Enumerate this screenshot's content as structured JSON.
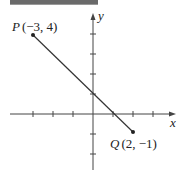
{
  "diagram": {
    "x_axis_label": "x",
    "y_axis_label": "y",
    "points": [
      {
        "name": "P",
        "coords": "(−3, 4)",
        "x": -3,
        "y": 4
      },
      {
        "name": "Q",
        "coords": "(2, −1)",
        "x": 2,
        "y": -1
      }
    ],
    "x_ticks": [
      -3,
      -2,
      -1,
      1,
      2,
      3
    ],
    "y_ticks": [
      1,
      2,
      3,
      4,
      -1,
      -2
    ],
    "line_color": "#333333"
  }
}
